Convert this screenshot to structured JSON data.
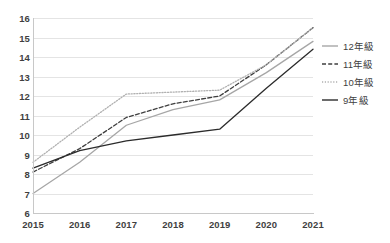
{
  "chart_data": {
    "type": "line",
    "title": "",
    "xlabel": "",
    "ylabel": "",
    "categories": [
      "2015",
      "2016",
      "2017",
      "2018",
      "2019",
      "2020",
      "2021"
    ],
    "x": [
      2015,
      2016,
      2017,
      2018,
      2019,
      2020,
      2021
    ],
    "ylim": [
      6,
      16
    ],
    "yticks": [
      "6",
      "7",
      "8",
      "9",
      "10",
      "11",
      "12",
      "13",
      "14",
      "15",
      "16"
    ],
    "grid": true,
    "legend_position": "right",
    "series": [
      {
        "name": "12年級",
        "style": "solid",
        "color": "#a6a6a6",
        "values": [
          7.0,
          8.6,
          10.5,
          11.3,
          11.8,
          13.2,
          14.8
        ]
      },
      {
        "name": "11年級",
        "style": "dashed",
        "color": "#3f3f3f",
        "values": [
          8.1,
          9.3,
          10.9,
          11.6,
          12.0,
          13.6,
          15.5
        ]
      },
      {
        "name": "10年級",
        "style": "dotted",
        "color": "#b0b0b0",
        "values": [
          8.6,
          10.4,
          12.1,
          12.2,
          12.3,
          13.6,
          15.5
        ]
      },
      {
        "name": "9年級",
        "style": "solid",
        "color": "#2b2b2b",
        "values": [
          8.3,
          9.2,
          9.7,
          10.0,
          10.3,
          12.4,
          14.4
        ]
      }
    ]
  },
  "legend": {
    "items": [
      {
        "label": "12年級"
      },
      {
        "label": "11年級"
      },
      {
        "label": "10年級"
      },
      {
        "label": "9年級"
      }
    ]
  }
}
